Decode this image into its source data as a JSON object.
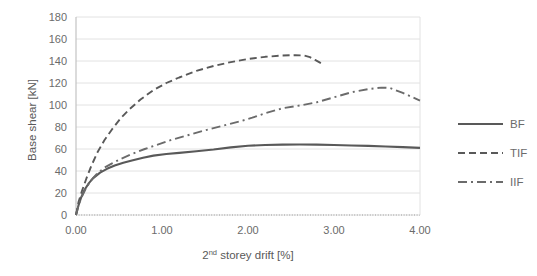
{
  "chart_data": {
    "type": "line",
    "title": "",
    "xlabel": "2nd storey drift [%]",
    "xlabel_base": "2",
    "xlabel_sup": "nd",
    "xlabel_rest": " storey drift [%]",
    "ylabel": "Base shear [kN]",
    "xlim": [
      0.0,
      4.0
    ],
    "ylim": [
      0,
      180
    ],
    "xticks": [
      "0.00",
      "1.00",
      "2.00",
      "3.00",
      "4.00"
    ],
    "xtick_values": [
      0.0,
      1.0,
      2.0,
      3.0,
      4.0
    ],
    "yticks": [
      "0",
      "20",
      "40",
      "60",
      "80",
      "100",
      "120",
      "140",
      "160",
      "180"
    ],
    "ytick_values": [
      0,
      20,
      40,
      60,
      80,
      100,
      120,
      140,
      160,
      180
    ],
    "grid": "horizontal",
    "legend_position": "right",
    "series": [
      {
        "name": "BF",
        "style": "solid",
        "color": "#595959",
        "x": [
          0.0,
          0.03,
          0.06,
          0.1,
          0.15,
          0.2,
          0.28,
          0.36,
          0.45,
          0.55,
          0.65,
          0.78,
          0.9,
          1.05,
          1.2,
          1.4,
          1.6,
          1.8,
          2.0,
          2.2,
          2.4,
          2.6,
          2.8,
          3.0,
          3.2,
          3.4,
          3.6,
          3.8,
          4.0
        ],
        "y": [
          0.0,
          9.0,
          16.0,
          23.0,
          29.0,
          33.5,
          38.5,
          42.0,
          45.0,
          47.5,
          49.5,
          52.0,
          54.0,
          55.5,
          56.5,
          58.0,
          59.5,
          61.5,
          63.0,
          63.6,
          64.0,
          64.1,
          64.0,
          63.6,
          63.2,
          62.8,
          62.3,
          61.7,
          61.0
        ]
      },
      {
        "name": "TIF",
        "style": "dashed",
        "color": "#595959",
        "x": [
          0.0,
          0.03,
          0.07,
          0.12,
          0.18,
          0.25,
          0.33,
          0.42,
          0.52,
          0.62,
          0.75,
          0.9,
          1.05,
          1.2,
          1.4,
          1.6,
          1.8,
          2.0,
          2.2,
          2.4,
          2.55,
          2.65,
          2.72,
          2.78,
          2.85
        ],
        "y": [
          0.0,
          12.0,
          22.0,
          33.0,
          45.0,
          57.0,
          68.0,
          78.0,
          88.0,
          96.0,
          105.0,
          113.5,
          120.0,
          125.0,
          131.0,
          135.5,
          139.0,
          141.8,
          143.8,
          145.0,
          145.3,
          145.0,
          143.5,
          141.0,
          138.0
        ]
      },
      {
        "name": "IIF",
        "style": "dashdot",
        "color": "#6b6b6b",
        "x": [
          0.0,
          0.03,
          0.07,
          0.12,
          0.18,
          0.25,
          0.33,
          0.42,
          0.52,
          0.65,
          0.8,
          0.95,
          1.1,
          1.3,
          1.5,
          1.7,
          1.9,
          2.05,
          2.2,
          2.4,
          2.6,
          2.8,
          3.0,
          3.2,
          3.4,
          3.55,
          3.65,
          3.8,
          4.0
        ],
        "y": [
          0.0,
          9.0,
          17.0,
          25.0,
          32.0,
          38.0,
          43.0,
          47.0,
          51.0,
          55.5,
          60.0,
          64.0,
          68.0,
          72.5,
          77.0,
          81.0,
          85.0,
          88.5,
          92.5,
          97.0,
          99.5,
          102.5,
          107.0,
          111.5,
          114.5,
          115.8,
          115.5,
          111.0,
          104.0
        ]
      }
    ]
  },
  "legend": {
    "items": [
      {
        "label": "BF",
        "style": "solid"
      },
      {
        "label": "TIF",
        "style": "dashed"
      },
      {
        "label": "IIF",
        "style": "dashdot"
      }
    ]
  }
}
